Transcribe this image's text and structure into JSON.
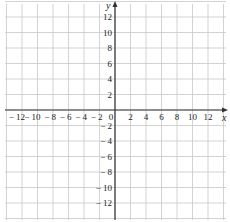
{
  "chart_data": {
    "type": "scatter",
    "title": "",
    "xlabel": "x",
    "ylabel": "y",
    "xlim": [
      -14,
      14
    ],
    "ylim": [
      -14,
      14
    ],
    "grid": true,
    "grid_step": 2,
    "x_ticks": [
      -12,
      -10,
      -8,
      -6,
      -4,
      -2,
      0,
      2,
      4,
      6,
      8,
      10,
      12
    ],
    "y_ticks": [
      -12,
      -10,
      -8,
      -6,
      -4,
      -2,
      2,
      4,
      6,
      8,
      10,
      12
    ],
    "x_tick_labels": [
      "− 12",
      "− 10",
      "− 8",
      "− 6",
      "− 4",
      "− 2",
      "0",
      "2",
      "4",
      "6",
      "8",
      "10",
      "12"
    ],
    "y_tick_labels": [
      "− 12",
      "− 10",
      "− 8",
      "− 6",
      "− 4",
      "− 2",
      "2",
      "4",
      "6",
      "8",
      "10",
      "12"
    ],
    "series": [],
    "legend": null
  },
  "colors": {
    "grid": "#c8c8c8",
    "axis": "#333333",
    "text": "#222222"
  }
}
